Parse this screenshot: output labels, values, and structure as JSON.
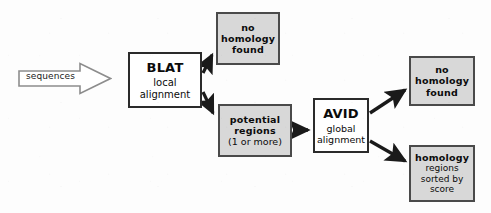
{
  "diagram": {
    "type": "flowchart",
    "title_visible": false,
    "background_color": "#fdfdfd",
    "colors": {
      "process_fill": "#ffffff",
      "process_border": "#2b2b2b",
      "terminal_fill": "#d8d8d8",
      "terminal_border": "#4a4a4a",
      "edge": "#1a1a1a",
      "text": "#0b0b0b"
    },
    "input": {
      "shape": "block-arrow",
      "label": "sequences"
    },
    "nodes": [
      {
        "id": "blat",
        "style": "white",
        "title": "BLAT",
        "subtitle_line1": "local",
        "subtitle_line2": "alignment"
      },
      {
        "id": "no-homology-found-blat",
        "style": "gray",
        "line1": "no",
        "line2": "homology",
        "line3": "found"
      },
      {
        "id": "potential-regions",
        "style": "gray",
        "line1": "potential",
        "line2": "regions",
        "line3": "(1 or more)"
      },
      {
        "id": "avid",
        "style": "white",
        "title": "AVID",
        "subtitle_line1": "global",
        "subtitle_line2": "alignment"
      },
      {
        "id": "no-homology-found-avid",
        "style": "gray",
        "line1": "no",
        "line2": "homology",
        "line3": "found"
      },
      {
        "id": "homology-regions-sorted",
        "style": "gray",
        "line1": "homology",
        "line2": "regions",
        "line3": "sorted by",
        "line4": "score"
      }
    ],
    "edges": [
      {
        "from": "sequences",
        "to": "blat"
      },
      {
        "from": "blat",
        "to": "no-homology-found-blat"
      },
      {
        "from": "blat",
        "to": "potential-regions"
      },
      {
        "from": "potential-regions",
        "to": "avid"
      },
      {
        "from": "avid",
        "to": "no-homology-found-avid"
      },
      {
        "from": "avid",
        "to": "homology-regions-sorted"
      }
    ]
  }
}
